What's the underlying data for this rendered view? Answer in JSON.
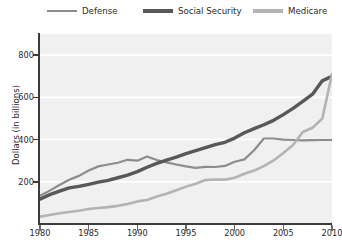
{
  "chart_data": {
    "type": "line",
    "title": "",
    "xlabel": "",
    "ylabel": "Dollars (in billions)",
    "xlim": [
      1980,
      2010
    ],
    "ylim": [
      0,
      900
    ],
    "grid": "horizontal-white",
    "legend_position": "top",
    "xticks": [
      1980,
      1985,
      1990,
      1995,
      2000,
      2005,
      2010
    ],
    "yticks": [
      200,
      400,
      600,
      800
    ],
    "x": [
      1980,
      1981,
      1982,
      1983,
      1984,
      1985,
      1986,
      1987,
      1988,
      1989,
      1990,
      1991,
      1992,
      1993,
      1994,
      1995,
      1996,
      1997,
      1998,
      1999,
      2000,
      2001,
      2002,
      2003,
      2004,
      2005,
      2006,
      2007,
      2008,
      2009,
      2010
    ],
    "series": [
      {
        "name": "Defense",
        "color": "#8c8c8c",
        "width": 2.2,
        "values": [
          134,
          158,
          185,
          210,
          228,
          253,
          273,
          282,
          290,
          304,
          300,
          320,
          303,
          292,
          282,
          273,
          266,
          271,
          270,
          275,
          295,
          306,
          349,
          405,
          405,
          400,
          398,
          396,
          397,
          398,
          398
        ]
      },
      {
        "name": "Social Security",
        "color": "#585858",
        "width": 3.4,
        "values": [
          118,
          139,
          156,
          171,
          178,
          188,
          198,
          207,
          219,
          232,
          248,
          269,
          287,
          302,
          317,
          333,
          347,
          362,
          376,
          387,
          407,
          432,
          452,
          470,
          491,
          518,
          548,
          581,
          615,
          678,
          700
        ]
      },
      {
        "name": "Medicare",
        "color": "#b3b3b3",
        "width": 2.6,
        "values": [
          35,
          43,
          51,
          57,
          63,
          71,
          76,
          80,
          86,
          95,
          107,
          114,
          130,
          143,
          160,
          177,
          191,
          208,
          211,
          210,
          219,
          238,
          253,
          274,
          301,
          336,
          374,
          436,
          456,
          499,
          710
        ]
      }
    ]
  },
  "legend": {
    "items": [
      {
        "label": "Defense"
      },
      {
        "label": "Social Security"
      },
      {
        "label": "Medicare"
      }
    ]
  },
  "axes": {
    "y_title": "Dollars (in billions)",
    "y_ticks": [
      "800",
      "600",
      "400",
      "200"
    ],
    "x_ticks": [
      "1980",
      "1985",
      "1990",
      "1995",
      "2000",
      "2005",
      "2010"
    ]
  }
}
